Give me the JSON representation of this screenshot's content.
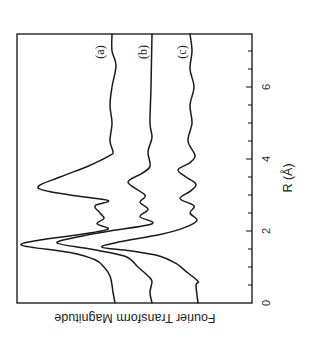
{
  "chart_data": {
    "type": "line",
    "orientation": "rotated 90 degrees clockwise (R axis vertical, magnitude increases to the left)",
    "title": "",
    "xlabel": "R (Å)",
    "ylabel": "Fourier Transform Magnitude",
    "xlim": [
      0,
      7.47
    ],
    "x_ticks": [
      0,
      2,
      4,
      6
    ],
    "x_minor_tick_step": 0.5,
    "y_ticks": [],
    "grid": false,
    "legend": "inline labels (a), (b), (c) at high-R end of each curve",
    "series": [
      {
        "name": "(a)",
        "x": [
          0,
          0.3,
          0.5,
          0.75,
          1.0,
          1.2,
          1.4,
          1.6,
          1.75,
          1.9,
          2.05,
          2.2,
          2.35,
          2.5,
          2.7,
          2.85,
          3.0,
          3.2,
          3.5,
          3.8,
          4.1,
          4.2,
          4.5,
          5.0,
          5.5,
          6.0,
          6.6,
          7.0,
          7.47
        ],
        "values": [
          13.7,
          13.9,
          14.0,
          14.2,
          14.8,
          15.7,
          18.2,
          23.0,
          21.2,
          17.2,
          14.4,
          15.5,
          14.8,
          15.2,
          15.7,
          14.4,
          18.2,
          21.4,
          19.2,
          16.4,
          14.2,
          13.9,
          14.2,
          14.0,
          14.2,
          14.0,
          13.6,
          14.0,
          14.0
        ]
      },
      {
        "name": "(b)",
        "x": [
          0,
          0.3,
          0.6,
          0.75,
          1.0,
          1.3,
          1.5,
          1.67,
          1.85,
          2.0,
          2.2,
          2.4,
          2.6,
          2.8,
          3.0,
          3.35,
          3.6,
          3.8,
          4.2,
          4.6,
          5.0,
          6.0,
          7.47
        ],
        "values": [
          10.0,
          10.2,
          10.0,
          10.4,
          11.4,
          12.7,
          16.2,
          19.5,
          17.2,
          14.2,
          10.0,
          11.2,
          10.4,
          11.2,
          10.7,
          12.4,
          11.0,
          10.2,
          10.4,
          10.0,
          10.2,
          10.1,
          10.0
        ]
      },
      {
        "name": "(c)",
        "x": [
          0,
          0.5,
          0.6,
          0.9,
          1.1,
          1.3,
          1.45,
          1.55,
          1.7,
          1.9,
          2.1,
          2.3,
          2.5,
          2.7,
          2.9,
          3.1,
          3.3,
          3.5,
          3.7,
          3.9,
          4.1,
          4.5,
          5.0,
          5.5,
          6.0,
          6.5,
          7.0,
          7.47
        ],
        "values": [
          5.4,
          5.6,
          5.4,
          6.7,
          7.6,
          9.2,
          12.2,
          15.0,
          13.2,
          9.2,
          6.7,
          5.5,
          6.2,
          5.8,
          7.2,
          6.2,
          5.6,
          6.6,
          7.4,
          6.2,
          5.7,
          6.4,
          6.0,
          6.2,
          5.8,
          6.2,
          6.0,
          6.2
        ]
      }
    ]
  },
  "labels": {
    "ylabel": "Fourier Transform Magnitude",
    "xlabel": "R (Å)",
    "ticks": [
      "0",
      "2",
      "4",
      "6"
    ],
    "series": [
      "(a)",
      "(b)",
      "(c)"
    ]
  },
  "colors": {
    "line": "#1a1a1a",
    "frame": "#222222",
    "background": "#ffffff"
  }
}
